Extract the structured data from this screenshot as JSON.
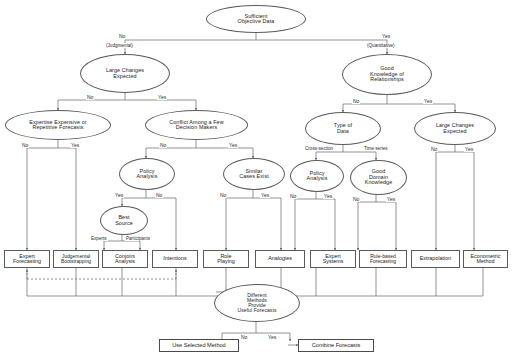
{
  "diagram": {
    "type": "decision-tree"
  },
  "nodes": {
    "sufficient_objective_data": "Sufficient\nObjective Data",
    "large_changes_expected_left": "Large Changes\nExpected",
    "good_knowledge_of_relationships": "Good\nKnowledge of\nRelationships",
    "expertise_expensive": "Expertise Expensive or\nRepetitive Forecasts",
    "conflict_among_few": "Conflict Among a Few\nDecision Makers",
    "type_of_data": "Type of\nData",
    "large_changes_expected_right": "Large Changes\nExpected",
    "policy_analysis_left": "Policy\nAnalysis",
    "similar_cases_exist": "Similar\nCases Exist",
    "policy_analysis_right": "Policy\nAnalysis",
    "good_domain_knowledge": "Good\nDomain\nKnowledge",
    "best_source": "Best\nSource",
    "different_methods": "Different\nMethods\nProvide\nUseful Forecasts"
  },
  "methods": {
    "expert_forecasting": "Expert\nForecasting",
    "judgemental_bootstrapping": "Judgemental\nBootstrapping",
    "conjoint_analysis": "Conjoint\nAnalysis",
    "intentions": "Intentions",
    "role_playing": "Role\nPlaying",
    "analogies": "Analogies",
    "expert_systems": "Expert\nSystems",
    "rule_based_forecasting": "Rule-based\nForecasting",
    "extrapolation": "Extrapolation",
    "econometric_method": "Econometric\nMethod"
  },
  "outcomes": {
    "use_selected_method": "Use Selected Method",
    "combine_forecasts": "Combine Forecasts"
  },
  "edge_labels": {
    "root_no": "No",
    "root_no_paren": "(Judgmental)",
    "root_yes": "Yes",
    "root_yes_paren": "(Quantitative)",
    "lce_left_no": "No",
    "lce_left_yes": "Yes",
    "gkr_no": "No",
    "gkr_yes": "Yes",
    "exp_no": "No",
    "exp_yes": "Yes",
    "conflict_no": "No",
    "conflict_yes": "Yes",
    "tod_cross": "Cross-section",
    "tod_time": "Time series",
    "lce_right_no": "No",
    "lce_right_yes": "Yes",
    "pa_left_yes": "Yes",
    "pa_left_no": "No",
    "sce_no": "No",
    "sce_yes": "Yes",
    "pa_right_no": "No",
    "pa_right_yes": "Yes",
    "gdk_no": "No",
    "gdk_yes": "Yes",
    "best_experts": "Experts",
    "best_participants": "Participants",
    "dm_no": "No",
    "dm_yes": "Yes"
  },
  "colors": {
    "stroke": "#5a5a5a",
    "text": "#1a1a1a",
    "background": "#ffffff"
  }
}
